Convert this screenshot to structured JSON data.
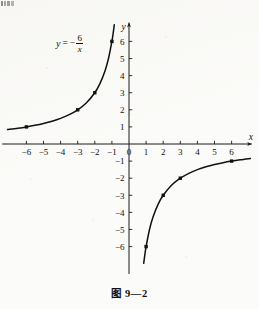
{
  "figure": {
    "caption": "图 9—2",
    "equation": {
      "lhs": "y",
      "equals": "=",
      "minus": "−",
      "numerator": "6",
      "denominator": "x",
      "full_text": "y = −6/x"
    }
  },
  "chart_data": {
    "type": "line",
    "title": "",
    "subtitle": "",
    "xlabel": "x",
    "ylabel": "y",
    "equation": "y = -6/x",
    "grid": false,
    "legend": false,
    "xlim": [
      -7.3,
      7.3
    ],
    "ylim": [
      -7.6,
      7.1
    ],
    "xticks": [
      -6,
      -5,
      -4,
      -3,
      -2,
      -1,
      0,
      1,
      2,
      3,
      4,
      5,
      6
    ],
    "yticks": [
      -6,
      -5,
      -4,
      -3,
      -2,
      -1,
      1,
      2,
      3,
      4,
      5,
      6
    ],
    "xticklabels": [
      "-6",
      "-5",
      "-4",
      "-3",
      "-2",
      "-1",
      "0",
      "1",
      "2",
      "3",
      "4",
      "5",
      "6"
    ],
    "yticklabels": [
      "-6",
      "-5",
      "-4",
      "-3",
      "-2",
      "-1",
      "1",
      "2",
      "3",
      "4",
      "5",
      "6"
    ],
    "origin_label": "0",
    "axis_arrows": [
      "x-positive",
      "y-positive"
    ],
    "series": [
      {
        "name": "branch-quadrant-II",
        "x": [
          -7.1,
          -6.5,
          -6,
          -5.5,
          -5,
          -4.5,
          -4,
          -3.5,
          -3,
          -2.5,
          -2,
          -1.7,
          -1.4,
          -1.2,
          -1,
          -0.92,
          -0.86
        ],
        "y": [
          0.845,
          0.923,
          1,
          1.091,
          1.2,
          1.333,
          1.5,
          1.714,
          2,
          2.4,
          3,
          3.529,
          4.286,
          5,
          6,
          6.522,
          6.977
        ]
      },
      {
        "name": "branch-quadrant-IV",
        "x": [
          0.86,
          0.92,
          1,
          1.2,
          1.4,
          1.7,
          2,
          2.5,
          3,
          3.5,
          4,
          4.5,
          5,
          5.5,
          6,
          6.5,
          7.1
        ],
        "y": [
          -6.977,
          -6.522,
          -6,
          -5,
          -4.286,
          -3.529,
          -3,
          -2.4,
          -2,
          -1.714,
          -1.5,
          -1.333,
          -1.2,
          -1.091,
          -1,
          -0.923,
          -0.845
        ]
      }
    ],
    "marked_points": [
      {
        "x": -6,
        "y": 1
      },
      {
        "x": -3,
        "y": 2
      },
      {
        "x": -2,
        "y": 3
      },
      {
        "x": -1,
        "y": 6
      },
      {
        "x": 1,
        "y": -6
      },
      {
        "x": 2,
        "y": -3
      },
      {
        "x": 3,
        "y": -2
      },
      {
        "x": 6,
        "y": -1
      }
    ],
    "colors": {
      "curve": "#111111",
      "axis": "#1b1b1b",
      "marker": "#111111",
      "background": "#fbfbf9"
    }
  }
}
